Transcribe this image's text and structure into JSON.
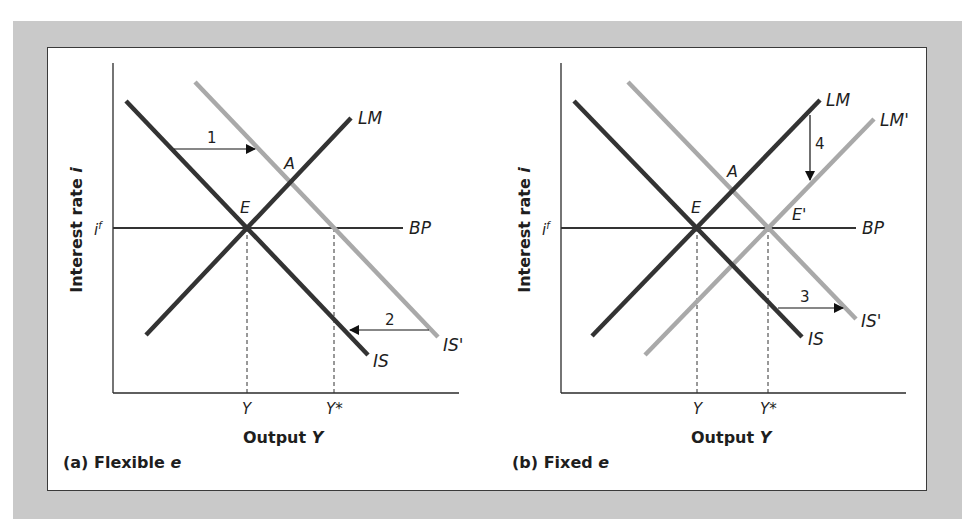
{
  "figure": {
    "panels": [
      {
        "id": "a",
        "caption_prefix": "(a) Flexible ",
        "caption_var": "e",
        "y_axis_title": "Interest rate ",
        "y_axis_var": "i",
        "x_axis_title": "Output ",
        "x_axis_var": "Y",
        "y_tick": "i",
        "y_tick_sup": "f",
        "x_ticks": [
          "Y",
          "Y*"
        ],
        "curves": {
          "is": "IS",
          "is_prime": "IS'",
          "lm": "LM",
          "bp": "BP"
        },
        "points": {
          "e": "E",
          "a": "A"
        },
        "arrows": {
          "step1": "1",
          "step2": "2"
        }
      },
      {
        "id": "b",
        "caption_prefix": "(b) Fixed ",
        "caption_var": "e",
        "y_axis_title": "Interest rate ",
        "y_axis_var": "i",
        "x_axis_title": "Output ",
        "x_axis_var": "Y",
        "y_tick": "i",
        "y_tick_sup": "f",
        "x_ticks": [
          "Y",
          "Y*"
        ],
        "curves": {
          "is": "IS",
          "is_prime": "IS'",
          "lm": "LM",
          "lm_prime": "LM'",
          "bp": "BP"
        },
        "points": {
          "e": "E",
          "a": "A",
          "e_prime": "E'"
        },
        "arrows": {
          "step3": "3",
          "step4": "4"
        }
      }
    ],
    "colors": {
      "frame": "#c9c9c9",
      "dark_curve": "#333333",
      "light_curve": "#a9a9a9",
      "axis": "#2a2a2a"
    }
  }
}
